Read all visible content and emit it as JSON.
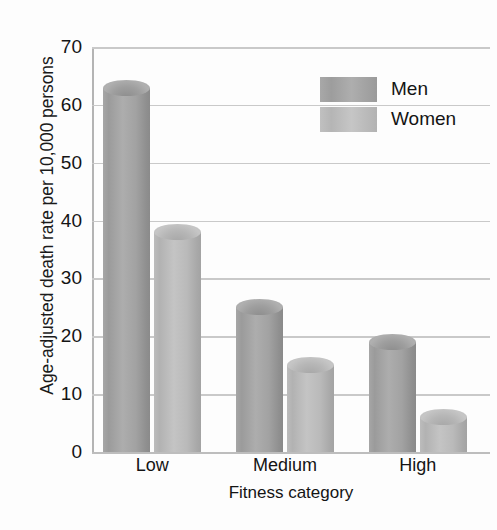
{
  "chart_data": {
    "type": "bar",
    "title": "",
    "subtitle": "",
    "xlabel": "Fitness category",
    "ylabel": "Age-adjusted death rate per 10,000 persons",
    "categories": [
      "Low",
      "Medium",
      "High"
    ],
    "series": [
      {
        "name": "Men",
        "values": [
          63,
          25,
          19
        ],
        "color": "#9e9e9e"
      },
      {
        "name": "Women",
        "values": [
          38,
          15,
          6
        ],
        "color": "#bdbdbd"
      }
    ],
    "ylim": [
      0,
      70
    ],
    "ytick_step": 10,
    "yticks": [
      0,
      10,
      20,
      30,
      40,
      50,
      60,
      70
    ],
    "ytick_labels": [
      "0",
      "10",
      "20",
      "30",
      "40",
      "50",
      "60",
      "70"
    ],
    "grid": true,
    "grid_axis": "y",
    "legend_position": "top-right",
    "bar_style": "cylinder",
    "annotations": []
  },
  "legend": {
    "entries": [
      {
        "label": "Men"
      },
      {
        "label": "Women"
      }
    ]
  }
}
